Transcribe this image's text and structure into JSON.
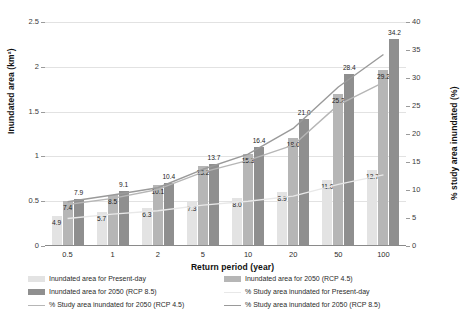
{
  "chart_data": {
    "type": "bar",
    "title": "",
    "xlabel": "Return period (year)",
    "ylabel": "Inundated area (km²)",
    "ylabel_secondary": "% study area inundated (%)",
    "categories": [
      "0.5",
      "1",
      "2",
      "5",
      "10",
      "20",
      "50",
      "100"
    ],
    "ylim": [
      0,
      2.5
    ],
    "yticks": [
      "0",
      "0.5",
      "1",
      "1.5",
      "2",
      "2.5"
    ],
    "ylim_secondary": [
      0,
      40
    ],
    "yticks_secondary": [
      "0",
      "5",
      "10",
      "15",
      "20",
      "25",
      "30",
      "35",
      "40"
    ],
    "grid": true,
    "legend_position": "bottom",
    "series": [
      {
        "name": "Inundated area for Present-day",
        "kind": "bar",
        "color": "#e3e3e3",
        "values": [
          0.33,
          0.38,
          0.42,
          0.49,
          0.54,
          0.6,
          0.74,
          0.85
        ],
        "labels": [
          "4.9",
          "5.7",
          "6.3",
          "7.3",
          "8.0",
          "8.9",
          "11.0",
          "12.7"
        ]
      },
      {
        "name": "Inundated area for 2050 (RCP 4.5)",
        "kind": "bar",
        "color": "#b6b6b6",
        "values": [
          0.5,
          0.57,
          0.68,
          0.89,
          1.03,
          1.21,
          1.7,
          1.97
        ],
        "labels": [
          "7.4",
          "8.5",
          "10.1",
          "13.2",
          "15.3",
          "18.0",
          "25.2",
          "29.2"
        ]
      },
      {
        "name": "Inundated area for 2050 (RCP 8.5)",
        "kind": "bar",
        "color": "#8f8f8f",
        "values": [
          0.53,
          0.61,
          0.7,
          0.92,
          1.11,
          1.42,
          1.92,
          2.31
        ],
        "labels": [
          "7.9",
          "9.1",
          "10.4",
          "13.7",
          "16.4",
          "21.0",
          "28.4",
          "34.2"
        ]
      },
      {
        "name": "% Study area inundated for Present-day",
        "kind": "line",
        "color": "#e8e8e8",
        "values": [
          4.9,
          5.7,
          6.3,
          7.3,
          8.0,
          8.9,
          11.0,
          12.7
        ]
      },
      {
        "name": "% Study area inundated for 2050 (RCP 4.5)",
        "kind": "line",
        "color": "#b6b6b6",
        "values": [
          7.4,
          8.5,
          10.1,
          13.2,
          15.3,
          18.0,
          25.2,
          29.2
        ]
      },
      {
        "name": "% Study area inundated for 2050 (RCP 8.5)",
        "kind": "line",
        "color": "#9a9a9a",
        "values": [
          7.9,
          9.1,
          10.4,
          13.7,
          16.4,
          21.0,
          28.4,
          34.2
        ]
      }
    ]
  },
  "legend": [
    {
      "label": "Inundated area for Present-day",
      "type": "swatch",
      "style": "present"
    },
    {
      "label": "Inundated area for 2050 (RCP 4.5)",
      "type": "swatch",
      "style": "rcp45"
    },
    {
      "label": "Inundated area for 2050 (RCP 8.5)",
      "type": "swatch",
      "style": "rcp85"
    },
    {
      "label": "% Study area inundated for Present-day",
      "type": "line",
      "style": "present"
    },
    {
      "label": "% Study area inundated for 2050 (RCP 4.5)",
      "type": "line",
      "style": "rcp45"
    },
    {
      "label": "% Study area inundated for 2050 (RCP 8.5)",
      "type": "line",
      "style": "rcp85"
    }
  ]
}
